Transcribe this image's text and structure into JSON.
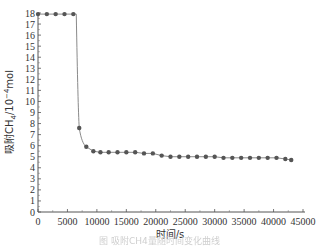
{
  "chart_data": {
    "type": "line",
    "title": "",
    "xlabel": "时间/s",
    "ylabel": "吸附CH4/10⁻⁴mol",
    "xlim": [
      0,
      45000
    ],
    "ylim": [
      0,
      18
    ],
    "x_ticks": [
      0,
      5000,
      10000,
      15000,
      20000,
      25000,
      30000,
      35000,
      40000,
      45000
    ],
    "y_ticks": [
      0,
      1,
      2,
      3,
      4,
      5,
      6,
      7,
      8,
      9,
      10,
      11,
      12,
      13,
      14,
      15,
      16,
      17,
      18
    ],
    "grid": false,
    "legend": null,
    "series": [
      {
        "name": "adsorbed CH4",
        "marker": "circle",
        "color": "#555555",
        "x": [
          0,
          1500,
          3000,
          4500,
          6000,
          7000,
          8200,
          9400,
          10600,
          12000,
          13500,
          15000,
          16500,
          18000,
          19500,
          21000,
          22500,
          24000,
          25500,
          27000,
          28500,
          30000,
          31500,
          33000,
          34500,
          36000,
          37500,
          39000,
          40500,
          42000,
          43000
        ],
        "y": [
          17.9,
          17.9,
          17.9,
          17.9,
          17.9,
          7.6,
          5.9,
          5.5,
          5.4,
          5.4,
          5.4,
          5.4,
          5.4,
          5.3,
          5.3,
          5.1,
          5.0,
          5.0,
          5.0,
          5.0,
          5.0,
          5.0,
          4.9,
          4.9,
          4.9,
          4.9,
          4.9,
          4.9,
          4.9,
          4.8,
          4.7
        ]
      }
    ]
  },
  "axis": {
    "y_title_prefix": "吸附CH",
    "y_title_sub": "4",
    "y_title_mid": "/10",
    "y_title_sup": "−4",
    "y_title_suffix": "mol",
    "x_title": "时间/s"
  },
  "caption": "图 吸附CH4量随时间变化曲线"
}
